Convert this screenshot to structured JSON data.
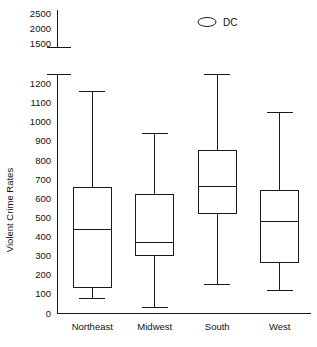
{
  "chart_data": {
    "type": "box",
    "title": "",
    "xlabel": "",
    "ylabel": "Violent Crime Rates",
    "categories": [
      "Northeast",
      "Midwest",
      "South",
      "West"
    ],
    "axis_break": true,
    "lower_axis": {
      "min": 0,
      "max": 1250,
      "ticks": [
        0,
        100,
        200,
        300,
        400,
        500,
        600,
        700,
        800,
        900,
        1000,
        1100,
        1200
      ],
      "tick_labels": [
        "0",
        "100",
        "200",
        "300",
        "400",
        "500",
        "600",
        "700",
        "800",
        "900",
        "1000",
        "1100",
        "1200"
      ]
    },
    "upper_axis": {
      "min": 1400,
      "max": 2600,
      "ticks": [
        1500,
        2000,
        2500
      ],
      "tick_labels": [
        "1500",
        "2000",
        "2500"
      ]
    },
    "boxes": [
      {
        "name": "Northeast",
        "whisker_low": 75,
        "q1": 135,
        "median": 437,
        "q3": 655,
        "whisker_high": 1160
      },
      {
        "name": "Midwest",
        "whisker_low": 27,
        "q1": 300,
        "median": 370,
        "q3": 620,
        "whisker_high": 940
      },
      {
        "name": "South",
        "whisker_low": 150,
        "q1": 522,
        "median": 662,
        "q3": 850,
        "whisker_high": 1248
      },
      {
        "name": "West",
        "whisker_low": 120,
        "q1": 263,
        "median": 480,
        "q3": 642,
        "whisker_high": 1050
      }
    ],
    "legend": {
      "position": "top",
      "entries": [
        {
          "label": "DC",
          "marker": "open-ellipse"
        }
      ]
    },
    "grid": false
  }
}
